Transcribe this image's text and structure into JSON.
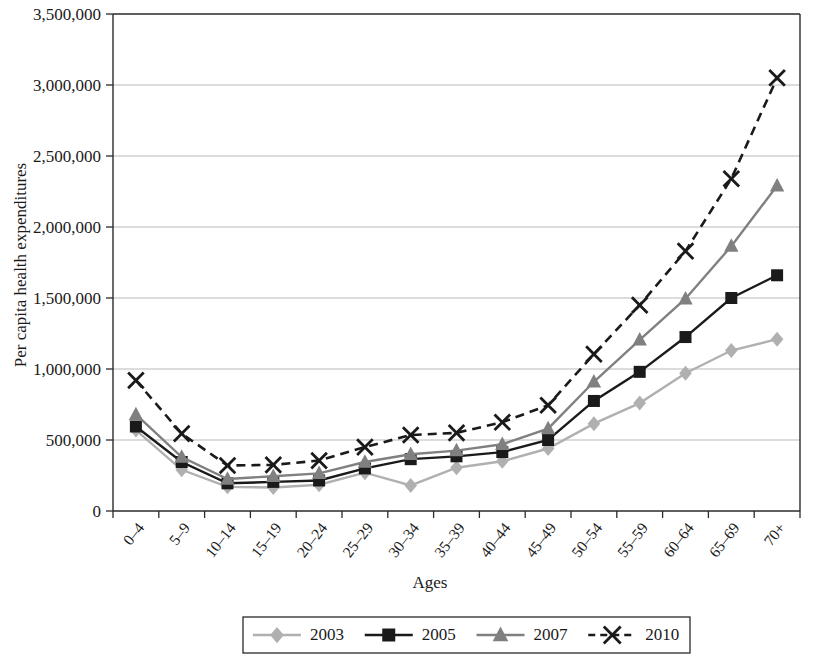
{
  "chart_data": {
    "type": "line",
    "title": "",
    "xlabel": "Ages",
    "ylabel": "Per capita health expenditures",
    "categories": [
      "0–4",
      "5–9",
      "10–14",
      "15–19",
      "20–24",
      "25–29",
      "30–34",
      "35–39",
      "40–44",
      "45–49",
      "50–54",
      "55–59",
      "60–64",
      "65–69",
      "70+"
    ],
    "ylim": [
      0,
      3500000
    ],
    "yticks": [
      0,
      500000,
      1000000,
      1500000,
      2000000,
      2500000,
      3000000,
      3500000
    ],
    "ytick_labels": [
      "0",
      "500,000",
      "1,000,000",
      "1,500,000",
      "2,000,000",
      "2,500,000",
      "3,000,000",
      "3,500,000"
    ],
    "grid": true,
    "legend_position": "bottom",
    "series": [
      {
        "name": "2003",
        "color": "#b0b0b0",
        "marker": "diamond",
        "dash": "solid",
        "values": [
          570000,
          290000,
          170000,
          165000,
          185000,
          270000,
          180000,
          305000,
          350000,
          440000,
          615000,
          760000,
          970000,
          1130000,
          1210000
        ]
      },
      {
        "name": "2005",
        "color": "#1a1a1a",
        "marker": "square",
        "dash": "solid",
        "values": [
          595000,
          345000,
          195000,
          205000,
          215000,
          300000,
          365000,
          385000,
          415000,
          500000,
          775000,
          980000,
          1225000,
          1500000,
          1660000
        ]
      },
      {
        "name": "2007",
        "color": "#808080",
        "marker": "triangle",
        "dash": "solid",
        "values": [
          680000,
          380000,
          225000,
          245000,
          265000,
          345000,
          400000,
          425000,
          470000,
          580000,
          910000,
          1205000,
          1495000,
          1865000,
          2290000
        ]
      },
      {
        "name": "2010",
        "color": "#1a1a1a",
        "marker": "cross",
        "dash": "dashed",
        "values": [
          920000,
          545000,
          320000,
          325000,
          355000,
          450000,
          535000,
          550000,
          625000,
          745000,
          1105000,
          1450000,
          1830000,
          2340000,
          3050000
        ]
      }
    ]
  },
  "legend": {
    "entries": [
      {
        "label": "2003"
      },
      {
        "label": "2005"
      },
      {
        "label": "2007"
      },
      {
        "label": "2010"
      }
    ]
  },
  "axes": {
    "x_title": "Ages",
    "y_title": "Per capita health expenditures"
  }
}
